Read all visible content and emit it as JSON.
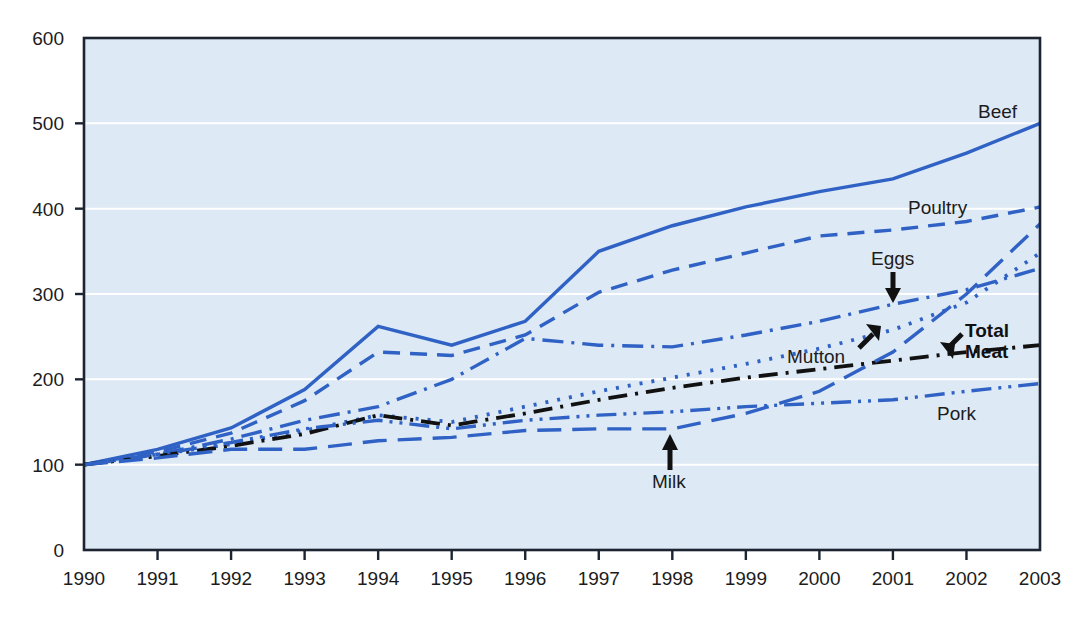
{
  "chart_data": {
    "type": "line",
    "title": "",
    "subtitle": "",
    "xlabel": "",
    "ylabel": "",
    "x": [
      1990,
      1991,
      1992,
      1993,
      1994,
      1995,
      1996,
      1997,
      1998,
      1999,
      2000,
      2001,
      2002,
      2003
    ],
    "categories": [
      "1990",
      "1991",
      "1992",
      "1993",
      "1994",
      "1995",
      "1996",
      "1997",
      "1998",
      "1999",
      "2000",
      "2001",
      "2002",
      "2003"
    ],
    "xlim": [
      1990,
      2003
    ],
    "ylim": [
      0,
      600
    ],
    "yticks": [
      0,
      100,
      200,
      300,
      400,
      500,
      600
    ],
    "ytick_labels": [
      "0",
      "100",
      "200",
      "300",
      "400",
      "500",
      "600"
    ],
    "grid": "horizontal",
    "legend_position": "inline-labels",
    "index_base": 100,
    "series": [
      {
        "name": "Beef",
        "label": "Beef",
        "style": "solid",
        "color": "#2f62c4",
        "values": [
          100,
          118,
          143,
          188,
          262,
          240,
          268,
          350,
          380,
          402,
          420,
          435,
          465,
          500
        ]
      },
      {
        "name": "Poultry",
        "label": "Poultry",
        "style": "dashed",
        "color": "#2f62c4",
        "values": [
          100,
          115,
          137,
          175,
          232,
          228,
          252,
          302,
          328,
          348,
          368,
          375,
          385,
          402
        ]
      },
      {
        "name": "Eggs",
        "label": "Eggs",
        "style": "dash-dot",
        "color": "#2f62c4",
        "values": [
          100,
          112,
          130,
          152,
          168,
          200,
          248,
          240,
          238,
          252,
          268,
          288,
          305,
          330
        ]
      },
      {
        "name": "Mutton",
        "label": "Mutton",
        "style": "dotted",
        "color": "#2f62c4",
        "values": [
          100,
          112,
          124,
          140,
          158,
          150,
          168,
          186,
          202,
          218,
          236,
          258,
          290,
          348
        ]
      },
      {
        "name": "Total Meat",
        "label": "Total Meat",
        "style": "dash-dot-black",
        "color": "#111111",
        "values": [
          100,
          110,
          122,
          136,
          158,
          146,
          160,
          176,
          190,
          202,
          212,
          222,
          232,
          240
        ]
      },
      {
        "name": "Milk",
        "label": "Milk",
        "style": "long-dash",
        "color": "#2f62c4",
        "values": [
          100,
          108,
          118,
          118,
          128,
          132,
          140,
          142,
          142,
          160,
          186,
          232,
          300,
          382
        ]
      },
      {
        "name": "Pork",
        "label": "Pork",
        "style": "dash-dot-dot",
        "color": "#2f62c4",
        "values": [
          100,
          112,
          126,
          142,
          152,
          142,
          152,
          158,
          162,
          168,
          172,
          176,
          186,
          195
        ]
      }
    ],
    "annotations": [
      {
        "text": "Beef",
        "kind": "inline-label",
        "series": "Beef"
      },
      {
        "text": "Poultry",
        "kind": "inline-label",
        "series": "Poultry"
      },
      {
        "text": "Eggs",
        "kind": "arrow-label",
        "series": "Eggs",
        "arrow": "down"
      },
      {
        "text": "Mutton",
        "kind": "arrow-label",
        "series": "Mutton",
        "arrow": "up-right"
      },
      {
        "text": "Total Meat",
        "kind": "arrow-label",
        "series": "Total Meat",
        "arrow": "down-right",
        "bold": true
      },
      {
        "text": "Milk",
        "kind": "arrow-label",
        "series": "Milk",
        "arrow": "up"
      },
      {
        "text": "Pork",
        "kind": "inline-label",
        "series": "Pork"
      }
    ]
  },
  "colors": {
    "plot_background": "#dde9f5",
    "gridline": "#ffffff",
    "axis": "#1b2430",
    "series_blue": "#2f62c4",
    "series_black": "#111111",
    "page_background": "#ffffff"
  },
  "labels": {
    "beef": "Beef",
    "poultry": "Poultry",
    "eggs": "Eggs",
    "mutton": "Mutton",
    "total_meat_line1": "Total",
    "total_meat_line2": "Meat",
    "milk": "Milk",
    "pork": "Pork"
  },
  "axis": {
    "y_labels": [
      "600",
      "500",
      "400",
      "300",
      "200",
      "100",
      "0"
    ],
    "x_labels": [
      "1990",
      "1991",
      "1992",
      "1993",
      "1994",
      "1995",
      "1996",
      "1997",
      "1998",
      "1999",
      "2000",
      "2001",
      "2002",
      "2003"
    ]
  }
}
